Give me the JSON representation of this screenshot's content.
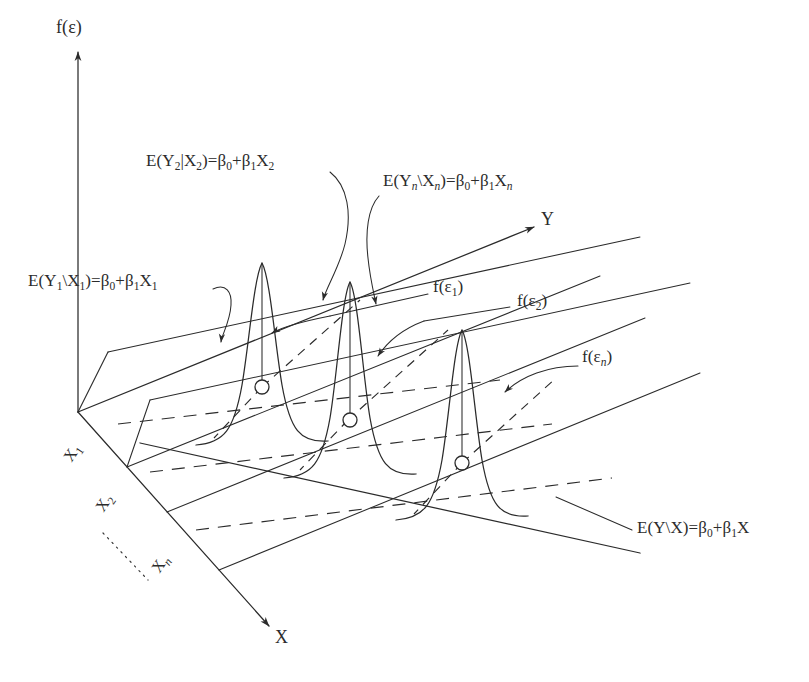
{
  "figure": {
    "background_color": "#ffffff",
    "line_color": "#2b2b2b"
  },
  "axes": {
    "vertical": {
      "label": "f(ε)",
      "name": "density-axis"
    },
    "depth": {
      "label": "Y",
      "name": "y-axis"
    },
    "horizontal": {
      "label": "X",
      "name": "x-axis"
    }
  },
  "tick_labels": [
    {
      "label_main": "X",
      "label_sub": "1"
    },
    {
      "label_main": "X",
      "label_sub": "2"
    },
    {
      "label_main": "X",
      "label_sub": "n",
      "italic_sub": true
    }
  ],
  "ellipsis": "······",
  "annotations": {
    "cond_mean_1": {
      "text_html": "E(Y<sub>1</sub>\\X<sub>1</sub>)=β<sub>0</sub>+β<sub>1</sub>X<sub>1</sub>",
      "text": "E(Y1\\X1)=β0+β1X1"
    },
    "cond_mean_2": {
      "text_html": "E(Y<sub>2</sub>|X<sub>2</sub>)=β<sub>0</sub>+β<sub>1</sub>X<sub>2</sub>",
      "text": "E(Y2|X2)=β0+β1X2"
    },
    "cond_mean_n": {
      "text_html": "E(Y<sub><i>n</i></sub>\\X<sub><i>n</i></sub>)=β<sub>0</sub>+β<sub>1</sub>X<sub><i>n</i></sub>",
      "text": "E(Yn\\Xn)=β0+β1Xn"
    },
    "density_1": {
      "text_html": "f(ε<sub>1</sub>)",
      "text": "f(ε1)"
    },
    "density_2": {
      "text_html": "f(ε<sub>2</sub>)",
      "text": "f(ε2)"
    },
    "density_n": {
      "text_html": "f(ε<sub><i>n</i></sub>)",
      "text": "f(εn)"
    },
    "population_line": {
      "text_html": "E(Y\\X)=β<sub>0</sub>+β<sub>1</sub>X",
      "text": "E(Y\\X)=β0+β1X"
    }
  },
  "chart_data": {
    "type": "diagram",
    "axes": {
      "vertical": "f(ε)",
      "depth": "Y",
      "horizontal": "X"
    },
    "regression_line": "E(Y\\X)=β0+β1X",
    "conditional_means": [
      "E(Y1\\X1)=β0+β1X1",
      "E(Y2|X2)=β0+β1X2",
      "E(Yn\\Xn)=β0+β1Xn"
    ],
    "densities": [
      "f(ε1)",
      "f(ε2)",
      "f(εn)"
    ],
    "x_levels": [
      "X1",
      "X2",
      "Xn"
    ],
    "n_distributions": 3,
    "grid": false,
    "legend": "none"
  }
}
